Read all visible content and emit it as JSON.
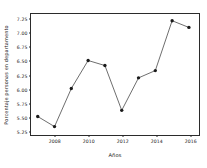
{
  "chart_data": {
    "type": "line",
    "title": "",
    "xlabel": "Años",
    "ylabel": "Porcentaje personas en departamento",
    "x": [
      2007,
      2008,
      2009,
      2010,
      2011,
      2012,
      2013,
      2014,
      2015,
      2016
    ],
    "values": [
      5.5,
      5.32,
      6.0,
      6.5,
      6.41,
      5.61,
      6.19,
      6.32,
      7.21,
      7.09
    ],
    "series": [
      {
        "name": "Porcentaje personas en departamento",
        "values": [
          5.5,
          5.32,
          6.0,
          6.5,
          6.41,
          5.61,
          6.19,
          6.32,
          7.21,
          7.09
        ]
      }
    ],
    "xlim": [
      2006.6,
      2016.6
    ],
    "ylim": [
      5.17,
      7.33
    ],
    "xticks": [
      2008,
      2010,
      2012,
      2014,
      2016
    ],
    "xtick_labels": [
      "2008",
      "2010",
      "2012",
      "2014",
      "2016"
    ],
    "xticks_minor": [
      2007,
      2009,
      2011,
      2013,
      2015
    ],
    "yticks": [
      5.25,
      5.5,
      5.75,
      6.0,
      6.25,
      6.5,
      6.75,
      7.0,
      7.25
    ],
    "ytick_labels": [
      "5.25",
      "5.50",
      "5.75",
      "6.00",
      "6.25",
      "6.50",
      "6.75",
      "7.00",
      "7.25"
    ],
    "grid": false,
    "legend": null,
    "marker": "circle",
    "line_color": "#2b2b2b",
    "marker_color": "#1a1a1a",
    "background_color": "#ffffff",
    "frame_color": "#2b2b2b"
  }
}
